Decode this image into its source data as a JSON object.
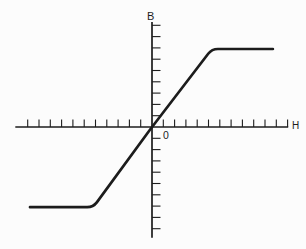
{
  "figure": {
    "y_axis_label": "B",
    "x_axis_label": "H",
    "origin_label": "0"
  },
  "colors": {
    "ink": "#1c1c1c",
    "background": "#fcfcfc"
  },
  "chart_data": {
    "type": "line",
    "title": "",
    "xlabel": "H",
    "ylabel": "B",
    "origin_label": "0",
    "x_axis": {
      "min": -12.1,
      "max": 12.05,
      "ticks_from": -11,
      "ticks_to": 12,
      "tick_step": 1,
      "grid": false,
      "tick_side": "above"
    },
    "y_axis": {
      "min": -9.8,
      "max": 9.3,
      "ticks_from": -9,
      "ticks_to": 9,
      "tick_step": 1,
      "grid": false,
      "tick_side": "right"
    },
    "legend": null,
    "series": [
      {
        "name": "magnetization-saturation-curve",
        "points": [
          [
            -10.8,
            -7.1
          ],
          [
            -5.2,
            -7.1
          ],
          [
            0,
            0
          ],
          [
            5.3,
            6.9
          ],
          [
            10.7,
            6.9
          ]
        ],
        "saturation_B": 7,
        "linear_region_H": [
          -5.2,
          5.3
        ],
        "color": "#1c1c1c"
      }
    ]
  }
}
